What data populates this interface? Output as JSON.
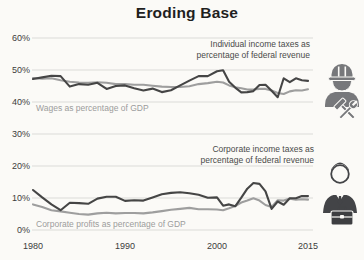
{
  "chart_data": {
    "type": "line",
    "title": "Eroding Base",
    "x": [
      1980,
      1981,
      1982,
      1983,
      1984,
      1985,
      1986,
      1987,
      1988,
      1989,
      1990,
      1991,
      1992,
      1993,
      1994,
      1995,
      1996,
      1997,
      1998,
      1999,
      2000,
      2001,
      2002,
      2003,
      2004,
      2005,
      2006,
      2007,
      2008,
      2009,
      2010,
      2011,
      2012,
      2013,
      2014,
      2015
    ],
    "xticks": [
      {
        "label": "1980",
        "year": 1980
      },
      {
        "label": "1990",
        "year": 1990
      },
      {
        "label": "2000",
        "year": 2000
      },
      {
        "label": "2015",
        "year": 2015
      }
    ],
    "yticks": [
      {
        "label": "0%",
        "value": 0
      },
      {
        "label": "10%",
        "value": 10
      },
      {
        "label": "20%",
        "value": 20
      },
      {
        "label": "30%",
        "value": 30
      },
      {
        "label": "40%",
        "value": 40
      },
      {
        "label": "50%",
        "value": 50
      },
      {
        "label": "60%",
        "value": 60
      }
    ],
    "ylim": [
      0,
      60
    ],
    "grid": true,
    "legend_position": "inline-annotations",
    "series": [
      {
        "name": "individual-income-taxes",
        "label": "Individual income taxes as\npercentage of federal revenue",
        "color": "#454545",
        "values": [
          47.2,
          47.7,
          48.2,
          48.1,
          44.8,
          45.6,
          45.4,
          46.0,
          44.1,
          45.0,
          45.2,
          44.3,
          43.6,
          44.2,
          43.1,
          43.7,
          45.2,
          46.7,
          48.1,
          48.1,
          49.6,
          49.9,
          46.3,
          44.5,
          43.0,
          43.1,
          43.4,
          45.3,
          45.4,
          43.5,
          41.5,
          47.4,
          46.2,
          47.4,
          46.8,
          46.6
        ]
      },
      {
        "name": "wages",
        "label": "Wages as percentage of GDP",
        "color": "#9e9e9e",
        "values": [
          47.5,
          47.3,
          47.4,
          46.8,
          46.3,
          46.1,
          46.0,
          46.2,
          46.0,
          45.6,
          45.6,
          45.4,
          45.4,
          45.1,
          44.8,
          44.7,
          44.7,
          44.9,
          45.6,
          45.9,
          46.3,
          46.1,
          45.2,
          44.6,
          44.3,
          43.9,
          43.9,
          44.1,
          44.1,
          43.6,
          42.8,
          42.5,
          43.3,
          43.7,
          43.6,
          44.0
        ]
      },
      {
        "name": "corporate-income-taxes",
        "label": "Corporate income taxes as\npercentage of federal revenue",
        "color": "#454545",
        "values": [
          12.5,
          10.2,
          8.0,
          6.2,
          8.5,
          8.4,
          8.2,
          9.8,
          10.4,
          10.4,
          9.1,
          9.3,
          9.2,
          10.2,
          11.2,
          11.6,
          11.8,
          11.5,
          11.0,
          10.1,
          10.2,
          7.6,
          8.0,
          7.4,
          10.1,
          12.9,
          14.7,
          14.4,
          12.1,
          6.6,
          8.9,
          7.9,
          9.9,
          9.9,
          10.6,
          10.6
        ]
      },
      {
        "name": "corporate-profits",
        "label": "Corporate profits as percentage of GDP",
        "color": "#9e9e9e",
        "values": [
          8.0,
          7.2,
          6.2,
          5.8,
          5.4,
          5.0,
          4.8,
          5.2,
          5.4,
          5.2,
          5.3,
          5.3,
          5.2,
          5.5,
          5.9,
          6.3,
          6.6,
          6.9,
          6.5,
          6.5,
          6.4,
          6.2,
          6.8,
          7.5,
          8.6,
          9.2,
          9.9,
          9.2,
          7.8,
          7.2,
          9.3,
          9.2,
          9.8,
          9.5,
          9.6,
          9.5
        ]
      }
    ]
  },
  "icons": [
    {
      "name": "construction-worker-icon"
    },
    {
      "name": "businessperson-briefcase-icon"
    }
  ],
  "colors": {
    "dark_line": "#454545",
    "gray_line": "#9e9e9e",
    "grid": "#dbdbd8",
    "background": "#fbfaf7",
    "axis_text": "#3c3c3c"
  }
}
